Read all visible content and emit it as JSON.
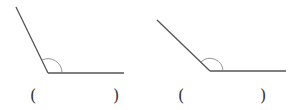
{
  "figures": [
    {
      "name": "angle-1",
      "ray1": {
        "x1": 16,
        "y1": 7,
        "x2": 48,
        "y2": 73
      },
      "ray2": {
        "x1": 48,
        "y1": 73,
        "x2": 124,
        "y2": 73
      },
      "arc": "M 62 73 A 14 14 0 0 0 42 60",
      "answer": {
        "open": "(",
        "close": ")",
        "value": ""
      }
    },
    {
      "name": "angle-2",
      "ray1": {
        "x1": 157,
        "y1": 20,
        "x2": 210,
        "y2": 71
      },
      "ray2": {
        "x1": 210,
        "y1": 71,
        "x2": 286,
        "y2": 71
      },
      "arc": "M 223 71 A 13 13 0 0 0 201 62",
      "answer": {
        "open": "(",
        "close": ")",
        "value": ""
      }
    }
  ],
  "colors": {
    "line": "#555555",
    "arc": "#888888",
    "text": "#333333"
  }
}
